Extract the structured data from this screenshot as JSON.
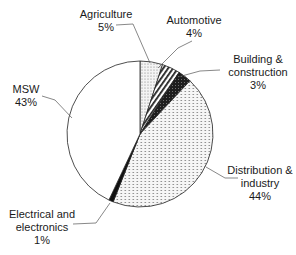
{
  "chart_data": {
    "type": "pie",
    "title": "",
    "start_angle_deg": 0,
    "direction": "clockwise",
    "slices": [
      {
        "label": "Agriculture",
        "value": 5,
        "pct_text": "5%",
        "pattern": "stipple"
      },
      {
        "label": "Automotive",
        "value": 4,
        "pct_text": "4%",
        "pattern": "diagonal-hatch"
      },
      {
        "label": "Building & construction",
        "value": 3,
        "pct_text": "3%",
        "pattern": "dark-dense"
      },
      {
        "label": "Distribution & industry",
        "value": 44,
        "pct_text": "44%",
        "pattern": "dotted"
      },
      {
        "label": "Electrical and electronics",
        "value": 1,
        "pct_text": "1%",
        "pattern": "black"
      },
      {
        "label": "MSW",
        "value": 43,
        "pct_text": "43%",
        "pattern": "white"
      }
    ],
    "legend": "none (data labels with leader lines)"
  },
  "labels": {
    "agriculture": {
      "name": "Agriculture",
      "pct": "5%"
    },
    "automotive": {
      "name": "Automotive",
      "pct": "4%"
    },
    "building": {
      "line1": "Building &",
      "line2": "construction",
      "pct": "3%"
    },
    "distribution": {
      "line1": "Distribution &",
      "line2": "industry",
      "pct": "44%"
    },
    "electrical": {
      "line1": "Electrical and",
      "line2": "electronics",
      "pct": "1%"
    },
    "msw": {
      "name": "MSW",
      "pct": "43%"
    }
  }
}
